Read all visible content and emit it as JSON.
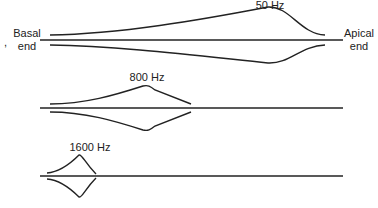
{
  "labels": {
    "basal": "Basal",
    "basal_end": "end",
    "apical": "Apical",
    "apical_end": "end",
    "tick": ","
  },
  "envelopes": [
    {
      "frequency_label": "50 Hz",
      "peak_position": "near apical end"
    },
    {
      "frequency_label": "800 Hz",
      "peak_position": "middle"
    },
    {
      "frequency_label": "1600 Hz",
      "peak_position": "near basal end"
    }
  ],
  "colors": {
    "line": "#222222",
    "background": "#ffffff"
  }
}
